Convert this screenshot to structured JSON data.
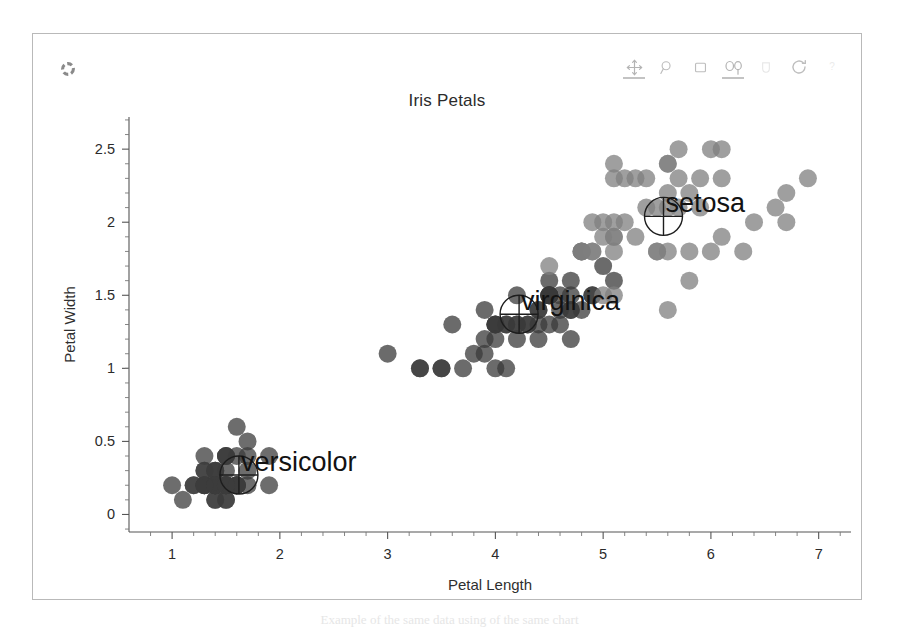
{
  "figure": {
    "corner_icon": "spinner-icon",
    "caption": "Example of the same data using of the same chart"
  },
  "modebar": {
    "buttons": [
      {
        "name": "pan-icon",
        "label": "Pan",
        "active": true,
        "dim": false
      },
      {
        "name": "zoom-icon",
        "label": "Zoom",
        "active": false,
        "dim": false
      },
      {
        "name": "box-select-icon",
        "label": "Box Select",
        "active": false,
        "dim": false
      },
      {
        "name": "lasso-select-icon",
        "label": "Lasso Select",
        "active": true,
        "dim": false
      },
      {
        "name": "pan-hand-icon",
        "label": "Drag",
        "active": false,
        "dim": true
      },
      {
        "name": "reset-axes-icon",
        "label": "Reset axes",
        "active": false,
        "dim": false
      },
      {
        "name": "help-icon",
        "label": "Help",
        "active": false,
        "dim": true
      }
    ]
  },
  "chart_data": {
    "type": "scatter",
    "title": "Iris Petals",
    "xlabel": "Petal Length",
    "ylabel": "Petal Width",
    "xlim": [
      0.6,
      7.3
    ],
    "ylim": [
      -0.12,
      2.72
    ],
    "grid": false,
    "legend_position": "none",
    "xticks": [
      "1",
      "2",
      "3",
      "4",
      "5",
      "6",
      "7"
    ],
    "xtick_values": [
      1,
      2,
      3,
      4,
      5,
      6,
      7
    ],
    "yticks": [
      "0",
      "0.5",
      "1",
      "1.5",
      "2",
      "2.5"
    ],
    "ytick_values": [
      0,
      0.5,
      1,
      1.5,
      2,
      2.5
    ],
    "minor_ticks": true,
    "marker_size": 9,
    "marker_opacity": 0.75,
    "annotations": [
      {
        "text": "versicolor",
        "x": 1.62,
        "y": 0.27,
        "glyph": "circle-crosshair"
      },
      {
        "text": "virginica",
        "x": 4.22,
        "y": 1.37,
        "glyph": "circle-crosshair"
      },
      {
        "text": "setosa",
        "x": 5.56,
        "y": 2.04,
        "glyph": "circle-crosshair"
      }
    ],
    "series": [
      {
        "name": "versicolor",
        "color": "#3c3c3c",
        "points": [
          [
            1.4,
            0.2
          ],
          [
            1.4,
            0.2
          ],
          [
            1.3,
            0.2
          ],
          [
            1.5,
            0.2
          ],
          [
            1.4,
            0.2
          ],
          [
            1.7,
            0.4
          ],
          [
            1.4,
            0.3
          ],
          [
            1.5,
            0.2
          ],
          [
            1.4,
            0.2
          ],
          [
            1.5,
            0.1
          ],
          [
            1.5,
            0.2
          ],
          [
            1.6,
            0.2
          ],
          [
            1.4,
            0.1
          ],
          [
            1.1,
            0.1
          ],
          [
            1.2,
            0.2
          ],
          [
            1.5,
            0.4
          ],
          [
            1.3,
            0.4
          ],
          [
            1.4,
            0.3
          ],
          [
            1.7,
            0.3
          ],
          [
            1.5,
            0.3
          ],
          [
            1.7,
            0.2
          ],
          [
            1.5,
            0.4
          ],
          [
            1.0,
            0.2
          ],
          [
            1.7,
            0.5
          ],
          [
            1.9,
            0.2
          ],
          [
            1.6,
            0.2
          ],
          [
            1.6,
            0.4
          ],
          [
            1.5,
            0.2
          ],
          [
            1.4,
            0.2
          ],
          [
            1.6,
            0.2
          ],
          [
            1.6,
            0.2
          ],
          [
            1.5,
            0.4
          ],
          [
            1.5,
            0.1
          ],
          [
            1.4,
            0.2
          ],
          [
            1.5,
            0.2
          ],
          [
            1.2,
            0.2
          ],
          [
            1.3,
            0.2
          ],
          [
            1.4,
            0.1
          ],
          [
            1.3,
            0.2
          ],
          [
            1.5,
            0.2
          ],
          [
            1.3,
            0.3
          ],
          [
            1.3,
            0.3
          ],
          [
            1.3,
            0.2
          ],
          [
            1.6,
            0.6
          ],
          [
            1.9,
            0.4
          ],
          [
            1.4,
            0.3
          ],
          [
            1.6,
            0.2
          ],
          [
            1.4,
            0.2
          ],
          [
            1.5,
            0.2
          ],
          [
            1.4,
            0.2
          ]
        ]
      },
      {
        "name": "virginica",
        "color": "#3a3a3a",
        "points": [
          [
            4.7,
            1.4
          ],
          [
            4.5,
            1.5
          ],
          [
            4.9,
            1.5
          ],
          [
            4.0,
            1.3
          ],
          [
            4.6,
            1.5
          ],
          [
            4.5,
            1.3
          ],
          [
            4.7,
            1.6
          ],
          [
            3.3,
            1.0
          ],
          [
            4.6,
            1.3
          ],
          [
            3.9,
            1.4
          ],
          [
            3.5,
            1.0
          ],
          [
            4.2,
            1.5
          ],
          [
            4.0,
            1.0
          ],
          [
            4.7,
            1.4
          ],
          [
            3.6,
            1.3
          ],
          [
            4.4,
            1.4
          ],
          [
            4.5,
            1.5
          ],
          [
            4.1,
            1.0
          ],
          [
            4.5,
            1.5
          ],
          [
            3.9,
            1.1
          ],
          [
            4.8,
            1.8
          ],
          [
            4.0,
            1.3
          ],
          [
            4.9,
            1.5
          ],
          [
            4.7,
            1.2
          ],
          [
            4.3,
            1.3
          ],
          [
            4.4,
            1.4
          ],
          [
            4.8,
            1.4
          ],
          [
            5.0,
            1.7
          ],
          [
            4.5,
            1.5
          ],
          [
            3.5,
            1.0
          ],
          [
            3.8,
            1.1
          ],
          [
            3.7,
            1.0
          ],
          [
            3.9,
            1.2
          ],
          [
            5.1,
            1.6
          ],
          [
            4.5,
            1.5
          ],
          [
            4.5,
            1.6
          ],
          [
            4.7,
            1.5
          ],
          [
            4.4,
            1.3
          ],
          [
            4.1,
            1.3
          ],
          [
            4.0,
            1.3
          ],
          [
            4.4,
            1.2
          ],
          [
            4.6,
            1.4
          ],
          [
            4.0,
            1.2
          ],
          [
            3.3,
            1.0
          ],
          [
            4.2,
            1.3
          ],
          [
            4.2,
            1.2
          ],
          [
            4.2,
            1.3
          ],
          [
            4.3,
            1.3
          ],
          [
            3.0,
            1.1
          ],
          [
            4.1,
            1.3
          ]
        ]
      },
      {
        "name": "setosa",
        "color": "#7f7f7f",
        "points": [
          [
            6.0,
            2.5
          ],
          [
            5.1,
            1.9
          ],
          [
            5.9,
            2.1
          ],
          [
            5.6,
            1.8
          ],
          [
            5.8,
            2.2
          ],
          [
            6.6,
            2.1
          ],
          [
            4.5,
            1.7
          ],
          [
            6.3,
            1.8
          ],
          [
            5.8,
            1.8
          ],
          [
            6.1,
            2.5
          ],
          [
            5.1,
            2.0
          ],
          [
            5.3,
            1.9
          ],
          [
            5.5,
            2.1
          ],
          [
            5.0,
            2.0
          ],
          [
            5.1,
            2.4
          ],
          [
            5.3,
            2.3
          ],
          [
            5.5,
            1.8
          ],
          [
            6.7,
            2.2
          ],
          [
            6.9,
            2.3
          ],
          [
            5.0,
            1.5
          ],
          [
            5.7,
            2.3
          ],
          [
            4.9,
            2.0
          ],
          [
            6.7,
            2.0
          ],
          [
            4.9,
            1.8
          ],
          [
            5.7,
            2.1
          ],
          [
            6.0,
            1.8
          ],
          [
            4.8,
            1.8
          ],
          [
            4.9,
            1.8
          ],
          [
            5.6,
            2.1
          ],
          [
            5.8,
            1.6
          ],
          [
            6.1,
            1.9
          ],
          [
            6.4,
            2.0
          ],
          [
            5.6,
            2.2
          ],
          [
            5.1,
            1.5
          ],
          [
            5.6,
            1.4
          ],
          [
            6.1,
            2.3
          ],
          [
            5.6,
            2.4
          ],
          [
            5.5,
            1.8
          ],
          [
            4.8,
            1.8
          ],
          [
            5.4,
            2.1
          ],
          [
            5.6,
            2.4
          ],
          [
            5.1,
            2.3
          ],
          [
            5.1,
            1.9
          ],
          [
            5.9,
            2.3
          ],
          [
            5.7,
            2.5
          ],
          [
            5.2,
            2.3
          ],
          [
            5.0,
            1.9
          ],
          [
            5.2,
            2.0
          ],
          [
            5.4,
            2.3
          ],
          [
            5.1,
            1.8
          ]
        ]
      }
    ]
  }
}
